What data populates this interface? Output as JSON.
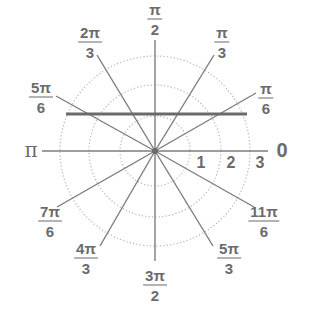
{
  "diagram": {
    "type": "polar-grid",
    "center": [
      155,
      151
    ],
    "ring_radii_px": [
      35,
      66,
      95
    ],
    "ring_labels": [
      "1",
      "2",
      "3"
    ],
    "colors": {
      "rays": "#7d7d7d",
      "rings": "#b5b5b5",
      "highlight_line": "#6a6a6a",
      "labels": "#6b6b6b"
    },
    "angle_labels": {
      "zero": "0",
      "pi": "π",
      "pi_over_6": {
        "num": "π",
        "den": "6"
      },
      "pi_over_3": {
        "num": "π",
        "den": "3"
      },
      "pi_over_2": {
        "num": "π",
        "den": "2"
      },
      "two_pi_over_3": {
        "num": "2π",
        "den": "3"
      },
      "five_pi_over_6": {
        "num": "5π",
        "den": "6"
      },
      "seven_pi_over_6": {
        "num": "7π",
        "den": "6"
      },
      "four_pi_over_3": {
        "num": "4π",
        "den": "3"
      },
      "three_pi_over_2": {
        "num": "3π",
        "den": "2"
      },
      "five_pi_over_3": {
        "num": "5π",
        "den": "3"
      },
      "eleven_pi_over_6": {
        "num": "11π",
        "den": "6"
      }
    },
    "highlight_line": {
      "description": "horizontal line segment above the origin",
      "y_px": 114,
      "x_start_px": 66,
      "x_end_px": 247
    }
  }
}
